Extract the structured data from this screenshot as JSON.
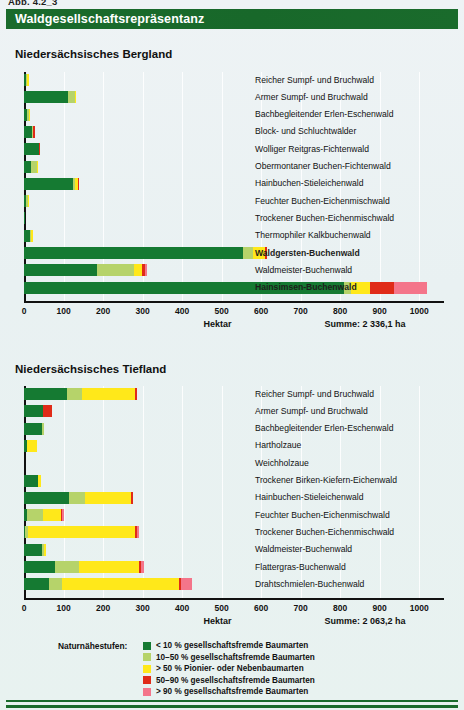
{
  "figure": {
    "caption": "Abb. 4.2_3",
    "title": "Waldgesellschaftsrepräsentanz",
    "title_bar_color": "#1a6b2c",
    "background_color": "#e9f1f2"
  },
  "naturalness_classes": [
    {
      "key": "n1",
      "label": "< 10 % gesellschaftsfremde Baumarten",
      "color": "#157a32"
    },
    {
      "key": "n2",
      "label": "10–50 % gesellschaftsfremde Baumarten",
      "color": "#b6d36a"
    },
    {
      "key": "n3",
      "label": "> 50 % Pionier- oder Nebenbaumarten",
      "color": "#ffe81a"
    },
    {
      "key": "n4",
      "label": "50–90 % gesellschaftsfremde Baumarten",
      "color": "#e02b18"
    },
    {
      "key": "n5",
      "label": "> 90 % gesellschaftsfremde Baumarten",
      "color": "#f4758a"
    }
  ],
  "legend": {
    "title": "Naturnähestufen:"
  },
  "chart_data": [
    {
      "id": "bergland",
      "type": "bar",
      "orientation": "horizontal",
      "stacked": true,
      "title": "Niedersächsisches Bergland",
      "xlabel": "Hektar",
      "ylabel": "",
      "xlim": [
        0,
        1050
      ],
      "xticks": [
        0,
        100,
        200,
        300,
        400,
        500,
        600,
        700,
        800,
        900,
        1000
      ],
      "grid": true,
      "legend_position": "bottom",
      "sum_label": "Summe: 2 336,1 ha",
      "sum_value": 2336.1,
      "series": [
        {
          "name": "< 10 % gesellschaftsfremde Baumarten",
          "color": "#157a32",
          "values": [
            5,
            112,
            8,
            20,
            38,
            18,
            124,
            6,
            3,
            14,
            555,
            185,
            810
          ]
        },
        {
          "name": "10–50 % gesellschaftsfremde Baumarten",
          "color": "#b6d36a",
          "values": [
            1,
            17,
            2,
            2,
            0,
            15,
            4,
            2,
            0,
            4,
            25,
            94,
            18
          ]
        },
        {
          "name": "> 50 % Pionier- oder Nebenbaumarten",
          "color": "#ffe81a",
          "values": [
            4,
            2,
            1,
            0,
            0,
            2,
            8,
            1,
            0,
            2,
            30,
            20,
            48
          ]
        },
        {
          "name": "50–90 % gesellschaftsfremde Baumarten",
          "color": "#e02b18",
          "values": [
            0,
            0,
            0,
            3,
            1,
            0,
            2,
            0,
            0,
            0,
            6,
            8,
            60
          ]
        },
        {
          "name": "> 90 % gesellschaftsfremde Baumarten",
          "color": "#f4758a",
          "values": [
            0,
            0,
            0,
            0,
            0,
            0,
            0,
            0,
            0,
            0,
            0,
            5,
            84
          ]
        }
      ],
      "categories": [
        "Reicher Sumpf- und Bruchwald",
        "Armer Sumpf- und Bruchwald",
        "Bachbegleitender Erlen-Eschenwald",
        "Block- und Schluchtwälder",
        "Wolliger Reitgras-Fichtenwald",
        "Obermontaner Buchen-Fichtenwald",
        "Hainbuchen-Stieleichenwald",
        "Feuchter Buchen-Eichenmischwald",
        "Trockener Buchen-Eichenmischwald",
        "Thermophiler Kalkbuchenwald",
        "Waldgersten-Buchenwald",
        "Waldmeister-Buchenwald",
        "Hainsimsen-Buchenwald"
      ]
    },
    {
      "id": "tiefland",
      "type": "bar",
      "orientation": "horizontal",
      "stacked": true,
      "title": "Niedersächsisches Tiefland",
      "xlabel": "Hektar",
      "ylabel": "",
      "xlim": [
        0,
        1050
      ],
      "xticks": [
        0,
        100,
        200,
        300,
        400,
        500,
        600,
        700,
        800,
        900,
        1000
      ],
      "grid": true,
      "legend_position": "bottom",
      "sum_label": "Summe: 2 063,2 ha",
      "sum_value": 2063.2,
      "series": [
        {
          "name": "< 10 % gesellschaftsfremde Baumarten",
          "color": "#157a32",
          "values": [
            108,
            48,
            46,
            8,
            0,
            35,
            114,
            7,
            3,
            46,
            78,
            62
          ]
        },
        {
          "name": "10–50 % gesellschaftsfremde Baumarten",
          "color": "#b6d36a",
          "values": [
            40,
            0,
            5,
            0,
            0,
            0,
            40,
            42,
            6,
            3,
            62,
            33
          ]
        },
        {
          "name": "> 50 % Pionier- oder Nebenbaumarten",
          "color": "#ffe81a",
          "values": [
            132,
            0,
            0,
            24,
            0,
            8,
            116,
            44,
            272,
            7,
            150,
            297
          ]
        },
        {
          "name": "50–90 % gesellschaftsfremde Baumarten",
          "color": "#e02b18",
          "values": [
            6,
            22,
            0,
            0,
            0,
            0,
            5,
            3,
            3,
            0,
            6,
            6
          ]
        },
        {
          "name": "> 90 % gesellschaftsfremde Baumarten",
          "color": "#f4758a",
          "values": [
            0,
            0,
            0,
            0,
            0,
            0,
            0,
            6,
            7,
            0,
            7,
            26
          ]
        }
      ],
      "categories": [
        "Reicher Sumpf- und Bruchwald",
        "Armer Sumpf- und Bruchwald",
        "Bachbegleitender Erlen-Eschenwald",
        "Hartholzaue",
        "Weichholzaue",
        "Trockener Birken-Kiefern-Eichenwald",
        "Hainbuchen-Stieleichenwald",
        "Feuchter Buchen-Eichenmischwald",
        "Trockener Buchen-Eichenmischwald",
        "Waldmeister-Buchenwald",
        "Flattergras-Buchenwald",
        "Drahtschmielen-Buchenwald"
      ]
    }
  ]
}
